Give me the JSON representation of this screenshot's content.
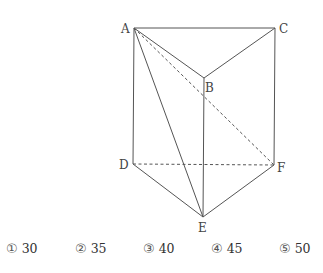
{
  "figure": {
    "vertices": {
      "A": {
        "label": "A",
        "x": 134,
        "y": 28
      },
      "B": {
        "label": "B",
        "x": 204,
        "y": 78
      },
      "C": {
        "label": "C",
        "x": 275,
        "y": 28
      },
      "D": {
        "label": "D",
        "x": 133,
        "y": 164
      },
      "E": {
        "label": "E",
        "x": 203,
        "y": 217
      },
      "F": {
        "label": "F",
        "x": 274,
        "y": 165
      }
    },
    "solid_edges": [
      "AC",
      "AB",
      "BC",
      "AD",
      "BE",
      "CF",
      "DE",
      "EF",
      "AE"
    ],
    "dashed_edges": [
      "DF",
      "AF"
    ],
    "line_color": "#555555"
  },
  "choices": [
    {
      "num": "①",
      "value": "30"
    },
    {
      "num": "②",
      "value": "35"
    },
    {
      "num": "③",
      "value": "40"
    },
    {
      "num": "④",
      "value": "45"
    },
    {
      "num": "⑤",
      "value": "50"
    }
  ]
}
